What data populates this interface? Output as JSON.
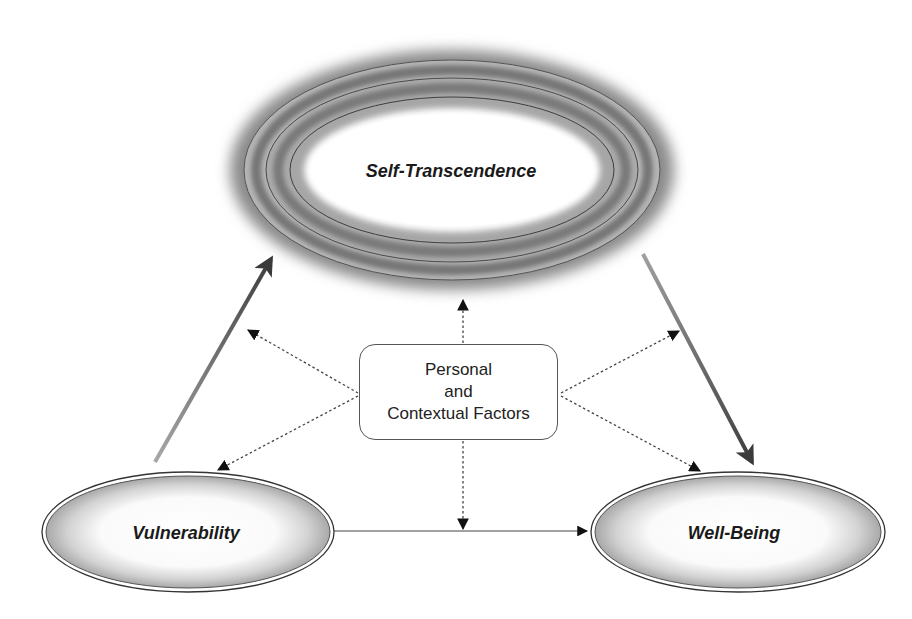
{
  "diagram": {
    "nodes": {
      "self_transcendence": {
        "label": "Self-Transcendence",
        "shape": "ellipse-halo"
      },
      "vulnerability": {
        "label": "Vulnerability",
        "shape": "ellipse"
      },
      "well_being": {
        "label": "Well-Being",
        "shape": "ellipse"
      },
      "factors": {
        "label_lines": [
          "Personal",
          "and",
          "Contextual Factors"
        ],
        "shape": "rounded-rect"
      }
    },
    "edges": [
      {
        "from": "Vulnerability",
        "to": "Self-Transcendence",
        "style": "solid-gradient"
      },
      {
        "from": "Self-Transcendence",
        "to": "Well-Being",
        "style": "solid-gradient"
      },
      {
        "from": "Vulnerability",
        "to": "Well-Being",
        "style": "solid-thin"
      },
      {
        "from": "Personal and Contextual Factors",
        "to": "Self-Transcendence",
        "style": "dotted"
      },
      {
        "from": "Personal and Contextual Factors",
        "to": "Vulnerability→Self-Transcendence path",
        "style": "dotted"
      },
      {
        "from": "Personal and Contextual Factors",
        "to": "Self-Transcendence→Well-Being path",
        "style": "dotted"
      },
      {
        "from": "Personal and Contextual Factors",
        "to": "Vulnerability",
        "style": "dotted"
      },
      {
        "from": "Personal and Contextual Factors",
        "to": "Well-Being",
        "style": "dotted"
      },
      {
        "from": "Personal and Contextual Factors",
        "to": "Vulnerability→Well-Being path",
        "style": "dotted"
      }
    ],
    "colors": {
      "ring_dark": "#6e6e6e",
      "ring_mid": "#9a9a9a",
      "line": "#333333",
      "arrow_dark": "#444444",
      "arrow_light": "#a0a0a0"
    }
  }
}
